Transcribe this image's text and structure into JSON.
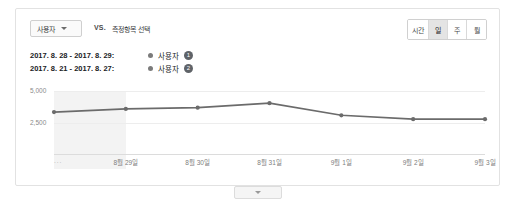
{
  "toolbar": {
    "metric_select_label": "사용자",
    "metric_select_icon": "chevron-down-icon",
    "vs_label": "VS.",
    "metric_picker_label": "측정항목 선택",
    "granularity": [
      {
        "label": "시간",
        "active": false
      },
      {
        "label": "일",
        "active": true
      },
      {
        "label": "주",
        "active": false
      },
      {
        "label": "월",
        "active": false
      }
    ]
  },
  "legend": {
    "rows": [
      {
        "date_range": "2017. 8. 28 - 2017. 8. 29:",
        "series_name": "사용자",
        "badge": "1"
      },
      {
        "date_range": "2017. 8. 21 - 2017. 8. 27:",
        "series_name": "사용자",
        "badge": "2"
      }
    ]
  },
  "footer": {
    "handle_icon": "chevron-down-icon"
  },
  "chart_data": {
    "type": "line",
    "title": "",
    "xlabel": "",
    "ylabel": "",
    "x": [
      "...",
      "8월 29일",
      "8월 30일",
      "8월 31일",
      "9월 1일",
      "9월 2일",
      "9월 3일"
    ],
    "categories": [
      "...",
      "8월 29일",
      "8월 30일",
      "8월 31일",
      "9월 1일",
      "9월 2일",
      "9월 3일"
    ],
    "series": [
      {
        "name": "사용자",
        "values": [
          3350,
          3600,
          3700,
          4050,
          3100,
          2800,
          2800
        ],
        "color": "#6b6b6b"
      }
    ],
    "ylim": [
      0,
      5000
    ],
    "yticks": [
      2500,
      5000
    ],
    "ytick_labels": [
      "2,500",
      "5,000"
    ],
    "grid": true,
    "legend_position": "top-left",
    "highlight_band": {
      "from_index": 0,
      "to_index": 1,
      "color": "#f1f1f1"
    }
  }
}
